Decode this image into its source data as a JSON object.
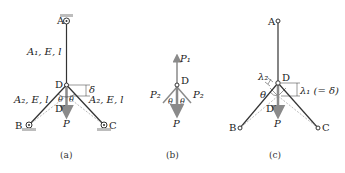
{
  "figures": [
    {
      "caption": "(a)",
      "nodes": {
        "A": "A",
        "B": "B",
        "C": "C",
        "D": "D",
        "D_prime": "D′"
      },
      "labels": {
        "bar_AD": "A₁, E, l",
        "bar_BD": "A₂, E, l",
        "bar_CD": "A₂, E, l",
        "load": "P",
        "deflection": "δ",
        "angle_left": "θ",
        "angle_right": "θ"
      }
    },
    {
      "caption": "(b)",
      "nodes": {
        "D": "D"
      },
      "labels": {
        "force_up": "P₁",
        "force_left": "P₂",
        "force_right": "P₂",
        "load": "P",
        "angle_left": "θ",
        "angle_right": "θ"
      }
    },
    {
      "caption": "(c)",
      "nodes": {
        "A": "A",
        "B": "B",
        "C": "C",
        "D": "D",
        "D_prime": "D′"
      },
      "labels": {
        "lambda2": "λ₂",
        "lambda1": "λ₁ (= δ)",
        "angle": "θ",
        "load": "P"
      }
    }
  ],
  "colors": {
    "line": "#333333",
    "arrow": "#8a8a8a",
    "dashed": "#aaaaaa",
    "ground": "#bdbdbd"
  }
}
